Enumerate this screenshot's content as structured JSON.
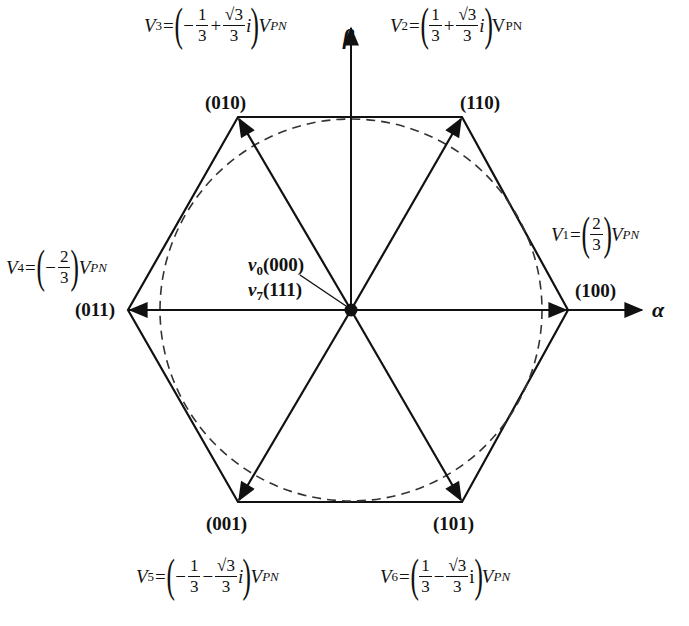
{
  "figure": {
    "type": "space-vector-hexagon",
    "axes": {
      "alpha_label": "α",
      "beta_label": "β"
    },
    "origin": {
      "zero_vectors": [
        {
          "name": "v",
          "sub": "0",
          "state": "(000)"
        },
        {
          "name": "v",
          "sub": "7",
          "state": "(111)"
        }
      ]
    },
    "vectors": [
      {
        "id": "V1",
        "name": "V",
        "sub": "1",
        "state": "(100)",
        "angle_deg": 0,
        "equation": {
          "sign1": "",
          "num1": "2",
          "den1": "3",
          "op": "",
          "num2": "",
          "den2": "",
          "imag": "",
          "unit": "V",
          "unit_sub": "PN"
        }
      },
      {
        "id": "V2",
        "name": "V",
        "sub": "2",
        "state": "(110)",
        "angle_deg": 60,
        "equation": {
          "sign1": "",
          "num1": "1",
          "den1": "3",
          "op": "+",
          "num2": "√3",
          "den2": "3",
          "imag": "i",
          "unit": "V",
          "unit_sub": "PN"
        }
      },
      {
        "id": "V3",
        "name": "V",
        "sub": "3",
        "state": "(010)",
        "angle_deg": 120,
        "equation": {
          "sign1": "−",
          "num1": "1",
          "den1": "3",
          "op": "+",
          "num2": "√3",
          "den2": "3",
          "imag": "i",
          "unit": "V",
          "unit_sub": "PN"
        }
      },
      {
        "id": "V4",
        "name": "V",
        "sub": "4",
        "state": "(011)",
        "angle_deg": 180,
        "equation": {
          "sign1": "−",
          "num1": "2",
          "den1": "3",
          "op": "",
          "num2": "",
          "den2": "",
          "imag": "",
          "unit": "V",
          "unit_sub": "PN"
        }
      },
      {
        "id": "V5",
        "name": "V",
        "sub": "5",
        "state": "(001)",
        "angle_deg": 240,
        "equation": {
          "sign1": "−",
          "num1": "1",
          "den1": "3",
          "op": "−",
          "num2": "√3",
          "den2": "3",
          "imag": "i",
          "unit": "V",
          "unit_sub": "PN"
        }
      },
      {
        "id": "V6",
        "name": "V",
        "sub": "6",
        "state": "(101)",
        "angle_deg": 300,
        "equation": {
          "sign1": "",
          "num1": "1",
          "den1": "3",
          "op": "−",
          "num2": "√3",
          "den2": "3",
          "imag": "i",
          "unit": "V",
          "unit_sub": "PN"
        }
      }
    ],
    "hexagon": {
      "center": [
        351,
        310
      ],
      "radius": 221,
      "stroke": "#111111"
    },
    "inscribed_circle": {
      "radius": 191,
      "style": "dashed",
      "stroke": "#333333"
    }
  }
}
